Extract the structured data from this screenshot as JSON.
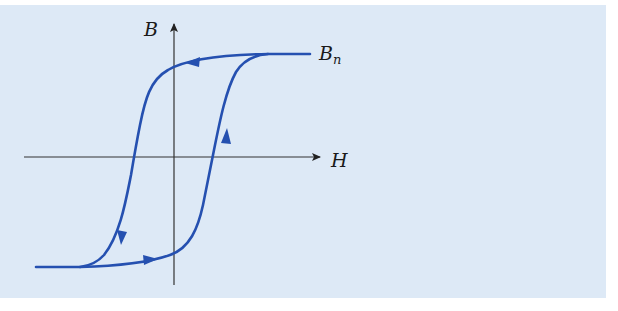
{
  "diagram": {
    "title": "",
    "type": "magnetic hysteresis loop",
    "axes": {
      "x_label": "H",
      "y_label": "B"
    },
    "annotations": [
      {
        "text": "B",
        "sub": "n",
        "meaning": "saturation point label"
      }
    ],
    "colors": {
      "background": "#dde9f6",
      "curve": "#2550b0",
      "axis": "#333333"
    },
    "curve": {
      "description": "closed hysteresis loop with direction arrows",
      "branches": [
        {
          "name": "upper-descending",
          "direction": "from Bn leftward then down",
          "arrows": 2
        },
        {
          "name": "lower-ascending",
          "direction": "from negative saturation rightward then up",
          "arrows": 2
        }
      ]
    }
  }
}
